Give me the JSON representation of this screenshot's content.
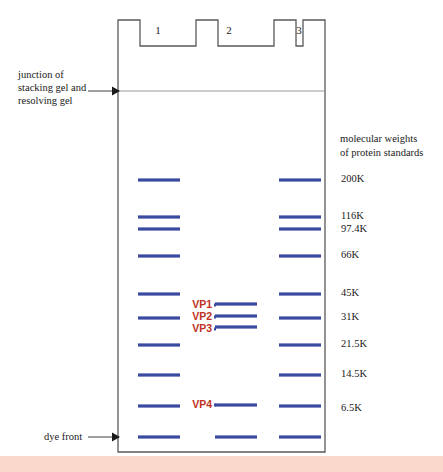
{
  "figure": {
    "type": "sds-page-gel-diagram",
    "colors": {
      "band": "#3a4a9f",
      "gel_outline": "#595959",
      "junction_line": "#9a9a9a",
      "vp_label": "#c0321e",
      "text": "#1a1a1a",
      "bottom_strip": "#f8d9cc",
      "background": "#ffffff"
    },
    "gel": {
      "left": 118,
      "right": 325,
      "top": 20,
      "bottom": 452,
      "tooth_top": 20,
      "well_bottom": 46
    }
  },
  "annotations": {
    "junction_label": "junction of\nstacking gel and\nresolving gel",
    "dye_front_label": "dye front",
    "standards_caption": "molecular weights\nof protein standards"
  },
  "lanes": [
    {
      "number": "1",
      "center_x": 158,
      "label_x": 148,
      "label_y": 30
    },
    {
      "number": "2",
      "center_x": 229,
      "label_x": 219,
      "label_y": 30
    },
    {
      "number": "3",
      "center_x": 299,
      "label_x": 289,
      "label_y": 30
    }
  ],
  "molecular_weight_standards": [
    {
      "label": "200K",
      "y": 180
    },
    {
      "label": "116K",
      "y": 217
    },
    {
      "label": "97.4K",
      "y": 230
    },
    {
      "label": "66K",
      "y": 256
    },
    {
      "label": "45K",
      "y": 294
    },
    {
      "label": "31K",
      "y": 318
    },
    {
      "label": "21.5K",
      "y": 345
    },
    {
      "label": "14.5K",
      "y": 375
    },
    {
      "label": "6.5K",
      "y": 409
    }
  ],
  "vp_labels": [
    {
      "label": "VP1",
      "y": 305
    },
    {
      "label": "VP2",
      "y": 317
    },
    {
      "label": "VP3",
      "y": 329
    },
    {
      "label": "VP4",
      "y": 405
    }
  ],
  "bands": {
    "lane1": [
      180,
      217,
      229,
      256,
      294,
      318,
      345,
      375,
      406,
      437
    ],
    "lane2": [
      304,
      316,
      327,
      405,
      437
    ],
    "lane3": [
      180,
      217,
      229,
      256,
      294,
      318,
      345,
      375,
      406,
      437
    ]
  },
  "band_geometry": {
    "lane1_x1": 138,
    "lane1_x2": 180,
    "lane2_x1": 215,
    "lane2_x2": 257,
    "lane3_x1": 279,
    "lane3_x2": 321,
    "thickness": 3.2
  },
  "junction": {
    "y": 91,
    "x1": 118,
    "x2": 325
  },
  "arrows": {
    "junction_arrow": {
      "x1": 88,
      "x2": 117,
      "y": 91
    },
    "dye_front_arrow": {
      "x1": 88,
      "x2": 117,
      "y": 437
    }
  }
}
